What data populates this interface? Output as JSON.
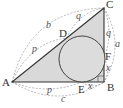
{
  "diagram": {
    "type": "geometry",
    "colors": {
      "triangle_fill": "#d9d9d9",
      "triangle_stroke": "#333333",
      "circle_fill": "#dcdcdc",
      "circle_stroke": "#333333",
      "arc_stroke": "#9a9a9a"
    },
    "points": {
      "A": "A",
      "B": "B",
      "C": "C",
      "D": "D",
      "E": "E",
      "F": "F"
    },
    "segment_labels": {
      "AC_total": "b",
      "CD": "q",
      "AD": "p",
      "CF": "q",
      "BC_total": "a",
      "FB": "x",
      "BE": "x",
      "AE": "p",
      "AB_total": "c"
    },
    "right_angle_at": "B",
    "caption_partial": ""
  }
}
